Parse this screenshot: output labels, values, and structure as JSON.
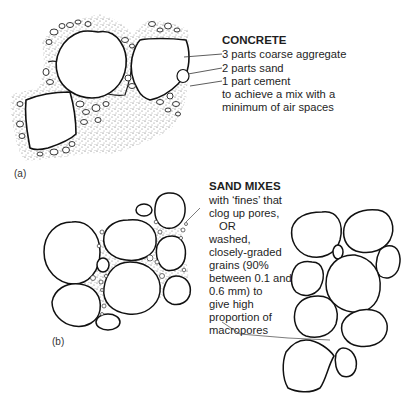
{
  "panel_a": {
    "label": "(a)",
    "title": "CONCRETE",
    "items": [
      "3 parts coarse aggregate",
      "2 parts sand",
      "1 part cement"
    ],
    "note_lines": [
      "to achieve a mix with a",
      "minimum of air spaces"
    ]
  },
  "panel_b": {
    "label": "(b)",
    "title": "SAND MIXES",
    "lines": [
      "with ‘fines’ that",
      "clog up pores,",
      "OR",
      "washed,",
      "closely-graded",
      "grains (90%",
      "between 0.1 and",
      "0.6 mm) to",
      "give high",
      "proportion of",
      "macropores"
    ]
  },
  "colors": {
    "ink": "#1a1a1a",
    "stipple": "#6b6b6b",
    "background": "#ffffff"
  }
}
